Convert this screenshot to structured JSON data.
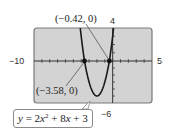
{
  "chart_data": {
    "type": "line",
    "title": "",
    "equation": "y = 2x^2 + 8x + 3",
    "equation_parts": {
      "y": "y",
      "eq": " = 2",
      "x1": "x",
      "exp": "2",
      "mid": " + 8",
      "x2": "x",
      "end": " + 3"
    },
    "xlim": [
      -10,
      5
    ],
    "ylim": [
      -6,
      4
    ],
    "tick_labels": {
      "xmin": "−10",
      "xmax": "5",
      "ymax": "4",
      "ymin": "−6"
    },
    "grid": false,
    "x_tick_step": 1,
    "y_tick_step": 1,
    "annotated_points": [
      {
        "x": -0.42,
        "y": 0,
        "label": "(−0.42, 0)"
      },
      {
        "x": -3.58,
        "y": 0,
        "label": "(−3.58, 0)"
      }
    ],
    "series": [
      {
        "name": "y = 2x^2 + 8x + 3",
        "a": 2,
        "b": 8,
        "c": 3,
        "x": [
          -4.6,
          -4,
          -3.58,
          -3,
          -2.5,
          -2,
          -1.5,
          -1,
          -0.42,
          0,
          0.3
        ],
        "values": [
          8.52,
          3,
          0,
          -3,
          -4.5,
          -5,
          -4.5,
          -3,
          0,
          3,
          5.58
        ]
      }
    ],
    "colors": {
      "screen": "#d3d3d3",
      "screen_border": "#7a7a7a",
      "curve": "#1a1a1a",
      "axis": "#333333"
    }
  }
}
